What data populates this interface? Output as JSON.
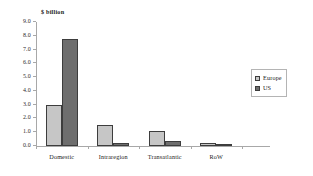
{
  "chart_data": {
    "type": "bar",
    "title": "$ billion",
    "xlabel": "",
    "ylabel": "",
    "ylim": [
      0.0,
      9.0
    ],
    "ytick_step": 1.0,
    "ytick_labels": [
      "0.0",
      "1.0",
      "2.0",
      "3.0",
      "4.0",
      "5.0",
      "6.0",
      "7.0",
      "8.0",
      "9.0"
    ],
    "grid": false,
    "legend_position": "right",
    "categories": [
      "Domestic",
      "Intraregion",
      "Transatlantic",
      "RoW"
    ],
    "series": [
      {
        "name": "Europe",
        "color": "#c6c6c6",
        "values": [
          3.0,
          1.5,
          1.1,
          0.2
        ]
      },
      {
        "name": "US",
        "color": "#6e6e6e",
        "values": [
          7.75,
          0.25,
          0.35,
          0.15
        ]
      }
    ]
  },
  "colors": {
    "europe": "#c6c6c6",
    "us": "#6e6e6e",
    "bar_border": "#3d3d3d",
    "axis": "#a8a8a8",
    "background": "#ffffff",
    "text": "#1a1a1a"
  }
}
